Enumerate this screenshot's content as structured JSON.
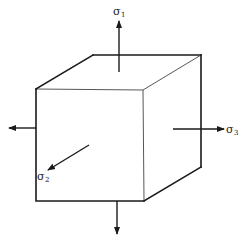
{
  "diagram": {
    "labels": {
      "sigma1": {
        "symbol": "σ",
        "subscript": "1"
      },
      "sigma2": {
        "symbol": "σ",
        "subscript": "2"
      },
      "sigma3": {
        "symbol": "σ",
        "subscript": "3"
      }
    },
    "colors": {
      "line": "#1a1a1a",
      "background": "#ffffff"
    }
  }
}
